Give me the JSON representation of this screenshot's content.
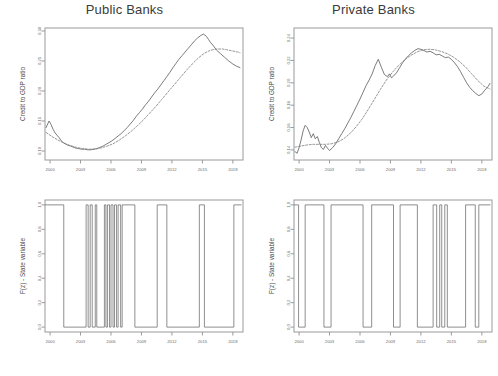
{
  "figure": {
    "background": "#ffffff",
    "line_color": "#5a5a5a",
    "axis_color": "#9a9a9a",
    "title_color": "#3b3b3b"
  },
  "panels": {
    "top_left": {
      "title": "Public Banks",
      "ylabel": "Credit to GDP ratio",
      "xticklabels": [
        "2000",
        "2003",
        "2006",
        "2009",
        "2012",
        "2015",
        "2018"
      ],
      "yticklabels": [
        "0.10",
        "0.15",
        "0.20",
        "0.25",
        "0.30"
      ]
    },
    "top_right": {
      "title": "Private Banks",
      "ylabel": "Credit to GDP ratio",
      "xticklabels": [
        "2000",
        "2003",
        "2006",
        "2009",
        "2012",
        "2015",
        "2018"
      ],
      "yticklabels": [
        "0.14",
        "0.16",
        "0.18",
        "0.20",
        "0.22",
        "0.24"
      ]
    },
    "bottom_left": {
      "title": "",
      "ylabel": "F(z) - State variable",
      "xticklabels": [
        "2000",
        "2003",
        "2006",
        "2009",
        "2012",
        "2015",
        "2018"
      ],
      "yticklabels": [
        "0.0",
        "0.2",
        "0.4",
        "0.6",
        "0.8",
        "1.0"
      ]
    },
    "bottom_right": {
      "title": "",
      "ylabel": "F(z) - State variable",
      "xticklabels": [
        "2000",
        "2003",
        "2006",
        "2009",
        "2012",
        "2015",
        "2018"
      ],
      "yticklabels": [
        "0.0",
        "0.2",
        "0.4",
        "0.6",
        "0.8",
        "1.0"
      ]
    }
  },
  "chart_data": [
    {
      "id": "public_banks_credit",
      "type": "line",
      "title": "Public Banks",
      "xlabel": "",
      "ylabel": "Credit to GDP ratio",
      "xlim": [
        1999.5,
        2019.0
      ],
      "ylim": [
        0.085,
        0.305
      ],
      "xticks": [
        2000,
        2003,
        2006,
        2009,
        2012,
        2015,
        2018
      ],
      "yticks": [
        0.1,
        0.15,
        0.2,
        0.25,
        0.3
      ],
      "grid": false,
      "legend": "none",
      "series": [
        {
          "name": "Credit to GDP ratio (observed)",
          "style": "solid",
          "x": [
            1999.6,
            1999.9,
            2000.1,
            2000.3,
            2000.5,
            2000.7,
            2000.9,
            2001.1,
            2001.3,
            2001.5,
            2001.7,
            2001.9,
            2002.2,
            2002.5,
            2002.8,
            2003.1,
            2003.4,
            2003.7,
            2004.0,
            2004.3,
            2004.6,
            2004.9,
            2005.2,
            2005.5,
            2005.8,
            2006.1,
            2006.4,
            2006.7,
            2007.0,
            2007.3,
            2007.6,
            2007.9,
            2008.2,
            2008.5,
            2008.8,
            2009.1,
            2009.4,
            2009.7,
            2010.0,
            2010.3,
            2010.6,
            2010.9,
            2011.2,
            2011.5,
            2011.8,
            2012.1,
            2012.4,
            2012.7,
            2013.0,
            2013.3,
            2013.6,
            2013.9,
            2014.2,
            2014.5,
            2014.8,
            2015.1,
            2015.4,
            2015.6,
            2015.8,
            2016.1,
            2016.4,
            2016.8,
            2017.2,
            2017.6,
            2018.0,
            2018.4,
            2018.7
          ],
          "y": [
            0.139,
            0.15,
            0.144,
            0.136,
            0.13,
            0.126,
            0.122,
            0.117,
            0.114,
            0.112,
            0.11,
            0.109,
            0.107,
            0.105,
            0.104,
            0.103,
            0.103,
            0.102,
            0.102,
            0.103,
            0.104,
            0.106,
            0.108,
            0.111,
            0.114,
            0.117,
            0.121,
            0.125,
            0.129,
            0.134,
            0.139,
            0.145,
            0.151,
            0.158,
            0.164,
            0.17,
            0.177,
            0.183,
            0.19,
            0.197,
            0.203,
            0.21,
            0.217,
            0.224,
            0.231,
            0.239,
            0.246,
            0.253,
            0.259,
            0.265,
            0.271,
            0.277,
            0.283,
            0.288,
            0.292,
            0.295,
            0.291,
            0.286,
            0.281,
            0.275,
            0.268,
            0.262,
            0.256,
            0.25,
            0.245,
            0.241,
            0.239
          ]
        },
        {
          "name": "Smoothed trend",
          "style": "dashed",
          "x": [
            1999.6,
            2000.2,
            2000.8,
            2001.4,
            2002.0,
            2002.6,
            2003.2,
            2003.8,
            2004.4,
            2005.0,
            2005.6,
            2006.2,
            2006.8,
            2007.4,
            2008.0,
            2008.6,
            2009.2,
            2009.8,
            2010.4,
            2011.0,
            2011.6,
            2012.2,
            2012.8,
            2013.4,
            2014.0,
            2014.6,
            2015.2,
            2015.8,
            2016.4,
            2017.0,
            2017.6,
            2018.2,
            2018.7
          ],
          "y": [
            0.131,
            0.124,
            0.118,
            0.113,
            0.109,
            0.106,
            0.104,
            0.103,
            0.103,
            0.105,
            0.108,
            0.112,
            0.118,
            0.125,
            0.133,
            0.142,
            0.152,
            0.163,
            0.174,
            0.186,
            0.198,
            0.21,
            0.222,
            0.234,
            0.245,
            0.255,
            0.263,
            0.268,
            0.27,
            0.27,
            0.268,
            0.266,
            0.264
          ]
        }
      ]
    },
    {
      "id": "private_banks_credit",
      "type": "line",
      "title": "Private Banks",
      "xlabel": "",
      "ylabel": "Credit to GDP ratio",
      "xlim": [
        1999.5,
        2019.0
      ],
      "ylim": [
        0.131,
        0.249
      ],
      "xticks": [
        2000,
        2003,
        2006,
        2009,
        2012,
        2015,
        2018
      ],
      "yticks": [
        0.14,
        0.16,
        0.18,
        0.2,
        0.22,
        0.24
      ],
      "grid": false,
      "legend": "none",
      "series": [
        {
          "name": "Credit to GDP ratio (observed)",
          "style": "solid",
          "x": [
            1999.6,
            1999.8,
            2000.0,
            2000.2,
            2000.4,
            2000.6,
            2000.8,
            2001.0,
            2001.2,
            2001.4,
            2001.6,
            2001.8,
            2002.0,
            2002.2,
            2002.4,
            2002.6,
            2002.8,
            2003.0,
            2003.3,
            2003.6,
            2003.9,
            2004.2,
            2004.5,
            2004.8,
            2005.1,
            2005.4,
            2005.7,
            2006.0,
            2006.3,
            2006.6,
            2006.9,
            2007.2,
            2007.5,
            2007.8,
            2008.1,
            2008.4,
            2008.7,
            2008.9,
            2009.1,
            2009.3,
            2009.6,
            2009.9,
            2010.2,
            2010.5,
            2010.8,
            2011.1,
            2011.4,
            2011.7,
            2012.0,
            2012.3,
            2012.6,
            2012.9,
            2013.2,
            2013.5,
            2013.8,
            2014.1,
            2014.4,
            2014.7,
            2015.0,
            2015.3,
            2015.6,
            2015.9,
            2016.2,
            2016.5,
            2016.8,
            2017.1,
            2017.4,
            2017.7,
            2018.0,
            2018.3,
            2018.6,
            2018.8
          ],
          "y": [
            0.1385,
            0.137,
            0.142,
            0.149,
            0.157,
            0.162,
            0.16,
            0.156,
            0.151,
            0.1545,
            0.15,
            0.152,
            0.1465,
            0.142,
            0.1405,
            0.144,
            0.1415,
            0.1395,
            0.142,
            0.1455,
            0.15,
            0.1545,
            0.159,
            0.164,
            0.169,
            0.1745,
            0.18,
            0.1855,
            0.1915,
            0.1975,
            0.2025,
            0.208,
            0.2155,
            0.221,
            0.214,
            0.2075,
            0.2055,
            0.208,
            0.2045,
            0.206,
            0.209,
            0.2135,
            0.218,
            0.2215,
            0.2245,
            0.227,
            0.229,
            0.2305,
            0.23,
            0.2288,
            0.2275,
            0.2282,
            0.2268,
            0.225,
            0.2255,
            0.224,
            0.2225,
            0.223,
            0.221,
            0.218,
            0.2145,
            0.21,
            0.205,
            0.2,
            0.196,
            0.193,
            0.1905,
            0.1885,
            0.19,
            0.1935,
            0.1965,
            0.1995
          ]
        },
        {
          "name": "Smoothed trend",
          "style": "dashed",
          "x": [
            1999.6,
            2000.2,
            2000.8,
            2001.4,
            2002.0,
            2002.6,
            2003.2,
            2003.8,
            2004.4,
            2005.0,
            2005.6,
            2006.2,
            2006.8,
            2007.4,
            2008.0,
            2008.6,
            2009.2,
            2009.8,
            2010.4,
            2011.0,
            2011.6,
            2012.2,
            2012.8,
            2013.4,
            2014.0,
            2014.6,
            2015.2,
            2015.8,
            2016.4,
            2017.0,
            2017.6,
            2018.2,
            2018.8
          ],
          "y": [
            0.1425,
            0.1435,
            0.1445,
            0.145,
            0.145,
            0.145,
            0.1455,
            0.147,
            0.15,
            0.1545,
            0.1605,
            0.1675,
            0.176,
            0.185,
            0.194,
            0.2025,
            0.2095,
            0.2155,
            0.2205,
            0.2245,
            0.2275,
            0.2295,
            0.23,
            0.2295,
            0.228,
            0.226,
            0.223,
            0.219,
            0.214,
            0.208,
            0.202,
            0.197,
            0.1945
          ]
        }
      ]
    },
    {
      "id": "public_banks_state",
      "type": "line",
      "title": "",
      "xlabel": "",
      "ylabel": "F(z) - State variable",
      "xlim": [
        1999.5,
        2019.0
      ],
      "ylim": [
        -0.04,
        1.04
      ],
      "xticks": [
        2000,
        2003,
        2006,
        2009,
        2012,
        2015,
        2018
      ],
      "yticks": [
        0.0,
        0.2,
        0.4,
        0.6,
        0.8,
        1.0
      ],
      "grid": false,
      "legend": "none",
      "series": [
        {
          "name": "F(z) regime indicator",
          "style": "step",
          "x": [
            1999.5,
            2001.35,
            2001.35,
            2003.55,
            2003.55,
            2003.75,
            2003.75,
            2003.95,
            2003.95,
            2004.15,
            2004.15,
            2004.45,
            2004.45,
            2004.6,
            2004.6,
            2005.35,
            2005.35,
            2005.5,
            2005.5,
            2005.65,
            2005.65,
            2005.85,
            2005.85,
            2006.0,
            2006.0,
            2006.2,
            2006.2,
            2006.35,
            2006.35,
            2006.55,
            2006.55,
            2006.7,
            2006.7,
            2006.95,
            2006.95,
            2007.1,
            2007.1,
            2008.35,
            2008.35,
            2010.55,
            2010.55,
            2011.5,
            2011.5,
            2014.7,
            2014.7,
            2015.2,
            2015.2,
            2018.1,
            2018.1,
            2018.85
          ],
          "y": [
            1.0,
            1.0,
            0.0,
            0.0,
            1.0,
            1.0,
            0.0,
            0.0,
            1.0,
            1.0,
            0.0,
            0.0,
            1.0,
            1.0,
            0.0,
            0.0,
            1.0,
            1.0,
            0.0,
            0.0,
            1.0,
            1.0,
            0.0,
            0.0,
            1.0,
            1.0,
            0.0,
            0.0,
            1.0,
            1.0,
            0.0,
            0.0,
            1.0,
            1.0,
            0.0,
            0.0,
            1.0,
            1.0,
            0.0,
            0.0,
            1.0,
            1.0,
            0.0,
            0.0,
            1.0,
            1.0,
            0.0,
            0.0,
            1.0,
            1.0
          ]
        }
      ]
    },
    {
      "id": "private_banks_state",
      "type": "line",
      "title": "",
      "xlabel": "",
      "ylabel": "F(z) - State variable",
      "xlim": [
        1999.5,
        2019.0
      ],
      "ylim": [
        -0.04,
        1.04
      ],
      "xticks": [
        2000,
        2003,
        2006,
        2009,
        2012,
        2015,
        2018
      ],
      "yticks": [
        0.0,
        0.2,
        0.4,
        0.6,
        0.8,
        1.0
      ],
      "grid": false,
      "legend": "none",
      "series": [
        {
          "name": "F(z) regime indicator",
          "style": "step",
          "x": [
            1999.5,
            1999.95,
            1999.95,
            2000.6,
            2000.6,
            2002.45,
            2002.45,
            2003.15,
            2003.15,
            2006.3,
            2006.3,
            2007.15,
            2007.15,
            2009.3,
            2009.3,
            2009.95,
            2009.95,
            2011.65,
            2011.65,
            2013.2,
            2013.2,
            2013.55,
            2013.55,
            2013.85,
            2013.85,
            2014.05,
            2014.05,
            2014.35,
            2014.35,
            2014.6,
            2014.6,
            2016.4,
            2016.4,
            2017.35,
            2017.35,
            2017.7,
            2017.7,
            2018.85
          ],
          "y": [
            1.0,
            1.0,
            0.0,
            0.0,
            1.0,
            1.0,
            0.0,
            0.0,
            1.0,
            1.0,
            0.0,
            0.0,
            1.0,
            1.0,
            0.0,
            0.0,
            1.0,
            1.0,
            0.0,
            0.0,
            1.0,
            1.0,
            0.0,
            0.0,
            1.0,
            1.0,
            0.0,
            0.0,
            1.0,
            1.0,
            0.0,
            0.0,
            1.0,
            1.0,
            0.0,
            0.0,
            1.0,
            1.0
          ]
        }
      ]
    }
  ]
}
